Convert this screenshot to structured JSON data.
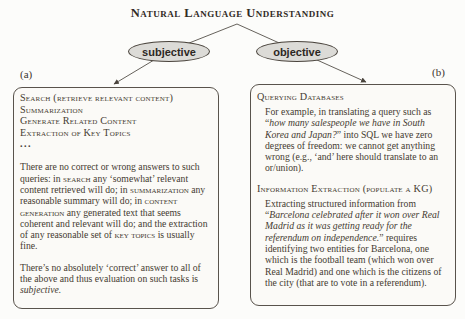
{
  "title": "Natural Language Understanding",
  "tree": {
    "left_node": "subjective",
    "right_node": "objective"
  },
  "panel_a": {
    "label": "(a)",
    "tasks": [
      "Search (retrieve relevant content)",
      "Summarization",
      "Generate Related Content",
      "Extraction of Key Topics",
      "..."
    ],
    "para1": [
      "There are no correct or wrong answers to such queries: in ",
      "search",
      " any ‘somewhat’ relevant content retrieved will do; in ",
      "summarization",
      " any reasonable summary will do; in ",
      "content generation",
      " any generated text that seems coherent and relevant will do; and the extraction of any reasonable set of ",
      "key topics",
      " is usually fine."
    ],
    "para2": [
      "There’s no absolutely ‘correct’ answer to all of the above and thus evaluation on such tasks is ",
      "subjective."
    ]
  },
  "panel_b": {
    "label": "(b)",
    "heading1": "Querying Databases",
    "para1": [
      "For example, in translating a query such as “",
      "how many salespeople we have in South Korea and Japan?",
      "” into SQL we have zero degrees of freedom: we cannot get anything wrong (e.g., ‘and’ here should translate to an or/union)."
    ],
    "heading2": "Information Extraction (populate a KG)",
    "para2": [
      "Extracting structured information from “",
      "Barcelona celebrated after it won over Real Madrid as it was getting ready for the referendum on independence.",
      "” requires identifying two entities for Barcelona, one which is the football team (which won over Real Madrid) and one which is the citizens of the city (that are to vote in a referendum)."
    ]
  },
  "colors": {
    "background": "#fcfcfa",
    "ink": "#453a31",
    "ellipse_fill": "#dcdbd7",
    "line": "#55504a"
  }
}
